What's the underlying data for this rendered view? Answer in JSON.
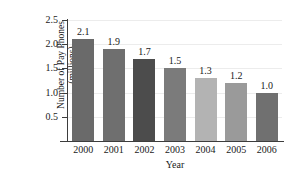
{
  "chart_data": {
    "type": "bar",
    "title": "",
    "xlabel": "Year",
    "ylabel": "Number of Pay Phones (millions)",
    "ylabel_line1": "Number of Pay Phones",
    "ylabel_line2": "(millions)",
    "categories": [
      "2000",
      "2001",
      "2002",
      "2003",
      "2004",
      "2005",
      "2006"
    ],
    "values": [
      2.1,
      1.9,
      1.7,
      1.5,
      1.3,
      1.2,
      1.0
    ],
    "value_labels": [
      "2.1",
      "1.9",
      "1.7",
      "1.5",
      "1.3",
      "1.2",
      "1.0"
    ],
    "bar_colors": [
      "#6a6a6a",
      "#6f6f6f",
      "#4c4c4c",
      "#7b7b7b",
      "#b3b3b3",
      "#9a9a9a",
      "#707070"
    ],
    "ylim": [
      0,
      2.5
    ],
    "yticks": [
      0.5,
      1.0,
      1.5,
      2.0,
      2.5
    ],
    "ytick_labels": [
      "0.5",
      "1.0",
      "1.5",
      "2.0",
      "2.5"
    ],
    "grid": true,
    "grid_color": "#ececec",
    "legend": "none",
    "axis_color": "#3d3d3d",
    "background": "#ffffff"
  }
}
